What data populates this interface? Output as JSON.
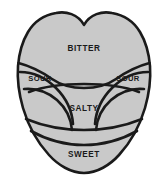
{
  "diagram": {
    "type": "anatomical-region-diagram",
    "background_color": "#ffffff",
    "region_fill_color": "#c9c9c9",
    "outline_color": "#1a1a1a",
    "label_color": "#1a1a1a"
  },
  "zones": [
    {
      "id": "bitter",
      "label": "BITTER",
      "position": "posterior-top",
      "label_x": 84,
      "label_y": 49
    },
    {
      "id": "sour-left",
      "label": "SOUR",
      "position": "lateral-left",
      "label_x": 40,
      "label_y": 79
    },
    {
      "id": "sour-right",
      "label": "SOUR",
      "position": "lateral-right",
      "label_x": 128,
      "label_y": 79
    },
    {
      "id": "salty",
      "label": "SALTY",
      "position": "central",
      "label_x": 84,
      "label_y": 109
    },
    {
      "id": "sweet",
      "label": "SWEET",
      "position": "anterior-tip",
      "label_x": 84,
      "label_y": 155
    }
  ]
}
